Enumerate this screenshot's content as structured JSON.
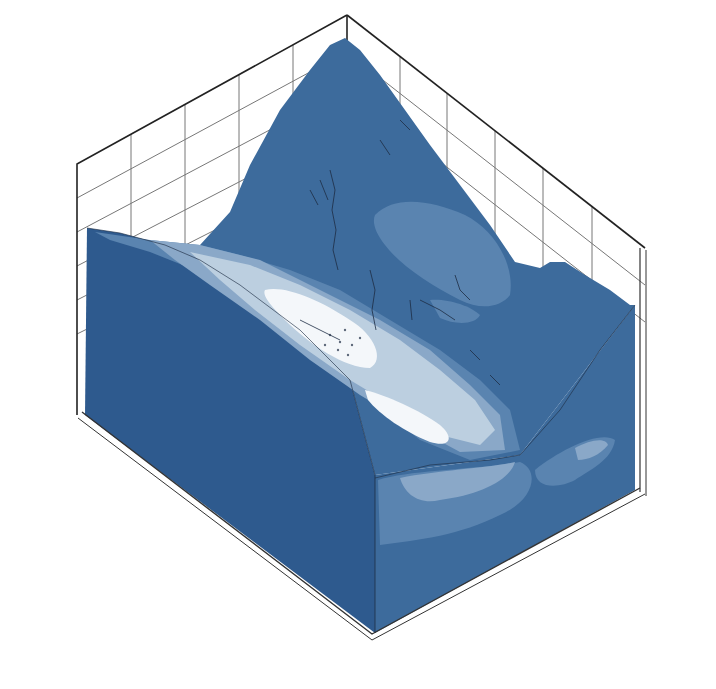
{
  "chart_data": {
    "type": "heatmap",
    "subtype": "3d-surface-contour",
    "title": "",
    "colorbar": {
      "label_var": "dx",
      "label_unit": "(mm)",
      "ticks": [
        "18",
        "16",
        "14",
        "12",
        "10",
        "8",
        "6",
        "4",
        "2",
        "0"
      ],
      "levels": [
        -1,
        0,
        2,
        4,
        6,
        8,
        10,
        12,
        14,
        16,
        18,
        19
      ],
      "colors": [
        "#2e5a8e",
        "#3d6b9c",
        "#5a84b0",
        "#8aa8c8",
        "#bccfe0",
        "#f4f7fa",
        "#fdebd3",
        "#f4c99c",
        "#dc9a6a",
        "#b0674a",
        "#7a3523"
      ]
    },
    "axes": {
      "x": {
        "label": "X(m)",
        "ticks": [
          "0",
          "460",
          "920",
          "1 380",
          "1 840",
          "2 300"
        ],
        "range": [
          0,
          2300
        ]
      },
      "y": {
        "label": "Y(m)",
        "ticks": [
          "0",
          "500",
          "1 000",
          "1 500",
          "2 000",
          "2 500",
          "3 000"
        ],
        "range": [
          0,
          3000
        ]
      },
      "z": {
        "label": "Z(m)",
        "ticks": [
          "-300",
          "0",
          "300",
          "600",
          "900",
          "1 200",
          "1 500",
          "1 800"
        ],
        "range": [
          -300,
          1800
        ]
      }
    },
    "observations": {
      "max_dx_region_mm": "8-10",
      "max_region_location": "central valley slope, X≈900-1400 m, Y≈1000-2000 m",
      "background_dx_mm": "0-2",
      "legend_position": "left"
    }
  },
  "colorbar_title": {
    "var": "dx",
    "unit": "(mm)"
  }
}
